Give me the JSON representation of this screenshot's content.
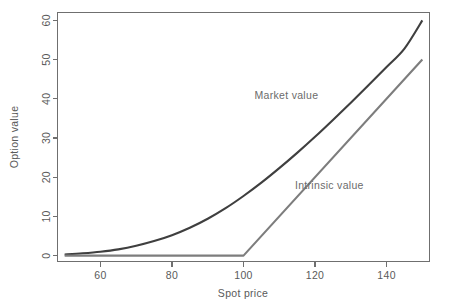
{
  "chart_data": {
    "type": "line",
    "title": "",
    "xlabel": "Spot price",
    "ylabel": "Option value",
    "xlim": [
      48,
      152
    ],
    "ylim": [
      -1.5,
      62
    ],
    "xticks": [
      60,
      80,
      100,
      120,
      140
    ],
    "xtick_labels": [
      "60",
      "80",
      "100",
      "120",
      "140"
    ],
    "yticks": [
      0,
      10,
      20,
      30,
      40,
      50,
      60
    ],
    "ytick_labels": [
      "0",
      "10",
      "20",
      "30",
      "40",
      "50",
      "60"
    ],
    "grid": false,
    "legend_position": "inline-annotations",
    "strike": 100,
    "series": [
      {
        "name": "Market value",
        "color": "#3f3f3f",
        "linewidth": 2.1,
        "annotation": "Market value",
        "annotation_xy": [
          112,
          40
        ],
        "x": [
          50,
          55,
          60,
          65,
          70,
          75,
          80,
          85,
          90,
          95,
          100,
          105,
          110,
          115,
          120,
          125,
          130,
          135,
          140,
          145,
          150
        ],
        "y": [
          0.3,
          0.6,
          1.0,
          1.6,
          2.5,
          3.7,
          5.2,
          7.1,
          9.4,
          12.1,
          15.2,
          18.6,
          22.3,
          26.2,
          30.3,
          34.6,
          39.0,
          43.5,
          48.1,
          52.8,
          60.0
        ]
      },
      {
        "name": "Intrinsic value",
        "color": "#7d7d7d",
        "linewidth": 2.1,
        "annotation": "Intrinsic value",
        "annotation_xy": [
          124,
          17
        ],
        "x": [
          50,
          100,
          150
        ],
        "y": [
          0,
          0,
          50
        ]
      }
    ]
  },
  "axes": {
    "x_axis_name": "Spot price",
    "y_axis_name": "Option value"
  }
}
